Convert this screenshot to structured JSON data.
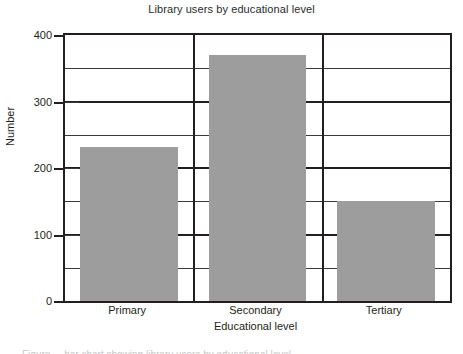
{
  "chart_data": {
    "type": "bar",
    "title": "Library users by educational level",
    "xlabel": "Educational level",
    "ylabel": "Number",
    "categories": [
      "Primary",
      "Secondary",
      "Tertiary"
    ],
    "values": [
      232,
      370,
      150
    ],
    "series": [
      {
        "name": "Number",
        "values": [
          232,
          370,
          150
        ]
      }
    ],
    "ylim": [
      0,
      400
    ],
    "ytick_labels": [
      "0",
      "100",
      "200",
      "300",
      "400"
    ],
    "ytick_values": [
      0,
      100,
      200,
      300,
      400
    ],
    "minor_gridline_values": [
      50,
      150,
      250,
      350
    ],
    "grid": "horizontal-major-and-minor, vertical-category-dividers",
    "legend": "none",
    "bar_color": "#9d9d9d",
    "axis_color": "#231f20",
    "gridline_color": "#3a3a3a",
    "background_color": "#ffffff"
  },
  "caption": {
    "sliver_text": "Figure ... bar chart showing library users by educational level"
  }
}
